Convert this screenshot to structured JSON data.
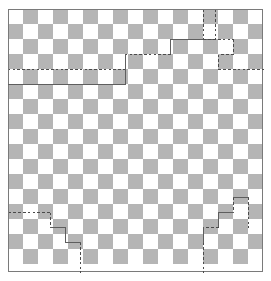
{
  "figure": {
    "type": "diagram",
    "caption": ""
  },
  "chart_data": {
    "type": "heatmap",
    "xlabel": "",
    "ylabel": "",
    "grid": true,
    "legend": false,
    "board": {
      "columns": 17,
      "rows": 17,
      "cell_size": 15,
      "origin_x": 8,
      "origin_y": 9,
      "parity_rule": "dark when (row + col) is odd",
      "colors": {
        "light_square": "#ffffff",
        "dark_square": "#b5b5b5",
        "frame": "#7a7a7a",
        "cut_solid": "#5e5e5e",
        "cut_dashed": "#4a4a4a",
        "background": "#ffffff"
      }
    },
    "frame": {
      "x": 8,
      "y": 9,
      "width": 255,
      "height": 263
    },
    "cuts": [
      {
        "name": "top-left-staircase",
        "corner": "top-left",
        "style": "mixed",
        "segments": [
          {
            "style": "dashed",
            "points": "215,9 215,39"
          },
          {
            "style": "solid",
            "points": "215,39 170,39"
          },
          {
            "style": "solid",
            "points": "170,39 170,54"
          },
          {
            "style": "dashed",
            "points": "170,54 125,54"
          },
          {
            "style": "solid",
            "points": "125,54 125,69"
          },
          {
            "style": "dashed",
            "points": "125,69 8,69"
          },
          {
            "style": "solid",
            "points": "125,69 125,84"
          },
          {
            "style": "solid",
            "points": "125,84 8,84"
          }
        ]
      },
      {
        "name": "top-right-staircase",
        "corner": "top-right",
        "style": "dashed",
        "segments": [
          {
            "style": "dashed",
            "points": "203,9 203,39"
          },
          {
            "style": "dashed",
            "points": "203,39 233,39"
          },
          {
            "style": "dashed",
            "points": "233,39 233,54"
          },
          {
            "style": "dashed",
            "points": "233,54 218,54"
          },
          {
            "style": "dashed",
            "points": "218,54 218,69"
          },
          {
            "style": "dashed",
            "points": "218,69 263,69"
          }
        ]
      },
      {
        "name": "bottom-left-staircase",
        "corner": "bottom-left",
        "style": "mixed",
        "segments": [
          {
            "style": "dashed",
            "points": "8,212 50,212"
          },
          {
            "style": "dashed",
            "points": "50,212 50,227"
          },
          {
            "style": "solid",
            "points": "50,227 65,227"
          },
          {
            "style": "solid",
            "points": "65,227 65,242"
          },
          {
            "style": "solid",
            "points": "65,242 80,242"
          },
          {
            "style": "dashed",
            "points": "80,242 80,272"
          }
        ]
      },
      {
        "name": "bottom-right-staircase",
        "corner": "bottom-right",
        "style": "mixed",
        "segments": [
          {
            "style": "dashed",
            "points": "248,197 248,227"
          },
          {
            "style": "solid",
            "points": "248,197 233,197"
          },
          {
            "style": "dashed",
            "points": "233,197 233,212"
          },
          {
            "style": "solid",
            "points": "233,212 218,212"
          },
          {
            "style": "solid",
            "points": "218,212 218,227"
          },
          {
            "style": "dashed",
            "points": "218,227 203,227"
          },
          {
            "style": "solid",
            "points": "203,227 203,242"
          },
          {
            "style": "dashed",
            "points": "203,242 203,272"
          }
        ]
      }
    ]
  }
}
